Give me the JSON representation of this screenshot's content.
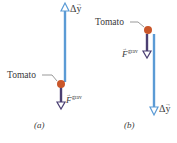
{
  "colors": {
    "displacement": "#5b9bd5",
    "gravity": "#4b3f72",
    "tomato": "#c9562a",
    "text": "#3a3a3a"
  },
  "panels": [
    {
      "id": "a",
      "caption": "(a)",
      "object_label": "Tomato",
      "displacement_label": "Δy",
      "displacement_direction": "up",
      "force_label": "F",
      "force_superscript": "grav",
      "force_direction": "down"
    },
    {
      "id": "b",
      "caption": "(b)",
      "object_label": "Tomato",
      "displacement_label": "Δy",
      "displacement_direction": "down",
      "force_label": "F",
      "force_superscript": "grav",
      "force_direction": "down"
    }
  ]
}
